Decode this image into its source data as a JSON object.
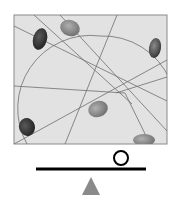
{
  "diagram": {
    "colors": {
      "frame_fill": "#e2e2e2",
      "frame_border": "#8a8a8a",
      "line": "#6e6e6e",
      "stone_dark": "#3a3a3a",
      "stone_mid": "#6a6a6a",
      "stone_light": "#8c8c8c",
      "beam": "#000000",
      "fulcrum": "#8a8a8a"
    },
    "frame": {
      "x": 14,
      "y": 15,
      "width": 153,
      "height": 129
    },
    "stones": [
      {
        "name": "stone-top-left-dark",
        "cx": 40,
        "cy": 39,
        "rx": 7,
        "ry": 11,
        "rotate": 15,
        "tone": "dark"
      },
      {
        "name": "stone-top-center",
        "cx": 70,
        "cy": 28,
        "rx": 10,
        "ry": 8,
        "rotate": 20,
        "tone": "light"
      },
      {
        "name": "stone-right-dark",
        "cx": 155,
        "cy": 48,
        "rx": 6,
        "ry": 10,
        "rotate": 10,
        "tone": "mid"
      },
      {
        "name": "stone-center",
        "cx": 98,
        "cy": 109,
        "rx": 10,
        "ry": 8,
        "rotate": -20,
        "tone": "light"
      },
      {
        "name": "stone-bottom-left",
        "cx": 27,
        "cy": 127,
        "rx": 8,
        "ry": 9,
        "rotate": -15,
        "tone": "dark"
      },
      {
        "name": "stone-bottom-right",
        "cx": 144,
        "cy": 140,
        "rx": 11,
        "ry": 6,
        "rotate": 0,
        "tone": "light"
      }
    ],
    "balance": {
      "beam": {
        "x1": 36,
        "y1": 169,
        "x2": 146,
        "y2": 169,
        "thickness": 3
      },
      "weight_circle": {
        "cx": 121,
        "cy": 158,
        "r": 7
      },
      "fulcrum": {
        "apex_x": 91,
        "apex_y": 177,
        "base_left": 82,
        "base_right": 100,
        "base_y": 195
      }
    }
  }
}
